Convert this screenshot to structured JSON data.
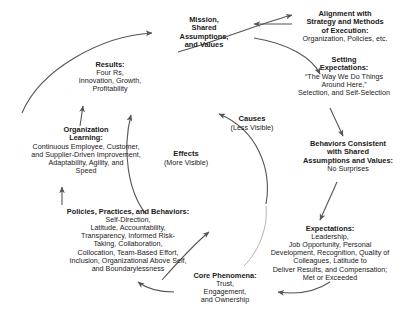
{
  "diagram": {
    "text_color": "#1a1a1a",
    "arrow_color": "#555555",
    "background": "#ffffff",
    "nodes": {
      "mission": {
        "title": "Mission, Shared Assumptions, and Values",
        "lines": [
          "Mission,",
          "Shared",
          "Assumptions,",
          "and Values"
        ]
      },
      "alignment": {
        "title": "Alignment with Strategy and Methods of Execution:",
        "title_lines": [
          "Alignment with",
          "Strategy and Methods",
          "of Execution:"
        ],
        "body": "Organization, Policies, etc."
      },
      "setting_expectations": {
        "title_lines": [
          "Setting",
          "Expectations:"
        ],
        "body": "“The Way We Do Things Around Here,” Selection, and Self-Selection",
        "body_lines": [
          "“The Way We Do Things",
          "Around Here,”",
          "Selection, and Self-Selection"
        ]
      },
      "behaviors": {
        "title_lines": [
          "Behaviors Consistent",
          "with Shared",
          "Assumptions and Values:"
        ],
        "body": "No Surprises"
      },
      "expectations": {
        "title_lines": [
          "Expectations:"
        ],
        "body": "Leadership, Job Opportunity, Personal Development, Recognition, Quality of Colleagues, Latitude to Deliver Results, and Compensation; Met or Exceeded",
        "body_lines": [
          "Leadership,",
          "Job Opportunity, Personal",
          "Development, Recognition, Quality of",
          "Colleagues, Latitude to",
          "Deliver Results, and Compensation;",
          "Met or Exceeded"
        ]
      },
      "core_phenomena": {
        "title_lines": [
          "Core Phenomena:"
        ],
        "body": "Trust, Engagement, and Ownership",
        "body_lines": [
          "Trust,",
          "Engagement,",
          "and Ownership"
        ]
      },
      "policies": {
        "title_lines": [
          "Policies, Practices, and Behaviors:"
        ],
        "body": "Self-Direction, Latitude, Accountability, Transparency, Informed Risk-Taking, Collaboration, Collocation, Team-Based Effort, Inclusion, Organizational Above Self, and Boundarylessness",
        "body_lines": [
          "Self-Direction,",
          "Latitude, Accountability,",
          "Transparency, Informed Risk-",
          "Taking, Collaboration,",
          "Collocation, Team-Based Effort,",
          "Inclusion, Organizational Above Self,",
          "and Boundarylessness"
        ]
      },
      "organization_learning": {
        "title_lines": [
          "Organization",
          "Learning:"
        ],
        "body": "Continuous Employee, Customer, and Supplier-Driven Improvement, Adaptability, Agility, and Speed",
        "body_lines": [
          "Continuous Employee, Customer,",
          "and Supplier-Driven Improvement,",
          "Adaptability, Agility, and",
          "Speed"
        ]
      },
      "results": {
        "title_lines": [
          "Results:"
        ],
        "body": "Four Rs, Innovation, Growth, Profitability",
        "body_lines": [
          "Four Rs,",
          "Innovation, Growth,",
          "Profitability"
        ]
      }
    },
    "center_labels": {
      "causes": {
        "title": "Causes",
        "body": "(Less Visible)"
      },
      "effects": {
        "title": "Effects",
        "body": "(More Visible)"
      }
    }
  }
}
